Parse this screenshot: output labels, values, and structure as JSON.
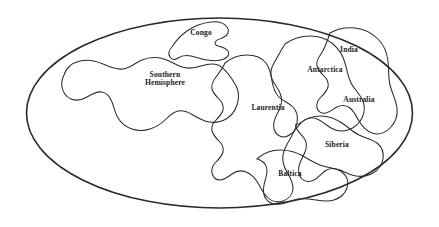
{
  "figure": {
    "kind": "paleogeographic-reconstruction-map",
    "projection_shape": "ellipse",
    "background_color": "#ffffff",
    "outline_color": "#2b2b2b",
    "label_color": "#1d1d1d",
    "globe": {
      "center_x": 219.5,
      "center_y": 113,
      "radius_x": 193,
      "radius_y": 95,
      "stroke_width": 1.6
    }
  },
  "labels": [
    {
      "id": "congo",
      "text": "Congo",
      "x": 201,
      "y": 33,
      "font_size": 7.6,
      "lines": [
        "Congo"
      ]
    },
    {
      "id": "southern-hemisphere",
      "text": "Southern Hemisphere",
      "x": 165,
      "y": 79,
      "font_size": 7.6,
      "lines": [
        "Southern",
        "Hemisphere"
      ]
    },
    {
      "id": "antarctica",
      "text": "Antarctica",
      "x": 325,
      "y": 70,
      "font_size": 7.6,
      "lines": [
        "Antarctica"
      ]
    },
    {
      "id": "india",
      "text": "India",
      "x": 349,
      "y": 50,
      "font_size": 7.6,
      "lines": [
        "India"
      ]
    },
    {
      "id": "australia",
      "text": "Australia",
      "x": 359,
      "y": 100,
      "font_size": 7.6,
      "lines": [
        "Australia"
      ]
    },
    {
      "id": "laurentia",
      "text": "Laurentia",
      "x": 268,
      "y": 108,
      "font_size": 7.6,
      "lines": [
        "Laurentia"
      ]
    },
    {
      "id": "siberia",
      "text": "Siberia",
      "x": 337,
      "y": 145,
      "font_size": 7.6,
      "lines": [
        "Siberia"
      ]
    },
    {
      "id": "baltica",
      "text": "Baltica",
      "x": 290,
      "y": 174,
      "font_size": 7.6,
      "lines": [
        "Baltica"
      ]
    }
  ],
  "landmasses": [
    {
      "id": "congo-craton",
      "name": "Congo",
      "path": "M172 47 C175 42 180 36 187 31 C194 26 202 23 211 22 C218 21 224 23 227 27 C230 31 228 35 224 37 C221 39 218 39 216 41 C214 43 215 45 218 46 C222 47 226 48 228 51 C230 54 228 57 224 59 C219 61 213 61 207 60 C201 59 196 57 191 56 C186 55 181 56 178 58 C175 60 172 60 170 57 C168 54 169 50 172 47 Z"
    },
    {
      "id": "southern-hemisphere-craton",
      "name": "Southern Hemisphere",
      "path": "M64 75 C66 68 72 63 80 61 C88 59 96 61 103 64 C110 67 116 70 123 69 C130 68 135 63 142 60 C149 57 157 57 164 59 C171 61 176 65 182 67 C188 69 195 68 201 66 C207 64 213 63 218 65 C223 67 226 71 229 75 C232 79 235 83 237 88 C239 93 239 99 237 105 C235 111 231 116 226 119 C221 122 215 123 209 122 C203 121 198 118 193 115 C188 112 183 110 178 111 C173 112 169 116 165 120 C161 124 156 127 150 129 C144 131 138 131 132 129 C126 127 121 123 118 118 C115 113 114 107 112 102 C110 97 107 93 102 92 C97 91 92 94 87 97 C82 100 76 101 71 99 C66 97 63 92 62 87 C61 82 62 79 64 75 Z"
    },
    {
      "id": "laurentia-craton",
      "name": "Laurentia",
      "path": "M225 63 C231 58 239 55 247 55 C255 55 262 58 266 63 C270 68 271 75 272 81 C273 87 275 93 279 97 C283 101 289 103 293 107 C297 111 298 117 297 123 C296 129 293 134 290 139 C287 144 284 149 283 155 C282 161 284 167 287 172 C290 177 293 182 293 188 C293 194 289 199 283 201 C277 203 271 201 267 197 C263 193 261 188 258 183 C255 178 251 174 246 172 C241 170 236 171 232 174 C228 177 224 180 220 180 C216 180 213 177 212 173 C211 169 213 165 216 162 C219 159 222 156 223 152 C224 148 222 144 219 141 C216 138 213 135 212 131 C211 127 213 123 216 120 C219 117 222 114 223 110 C224 106 222 102 219 99 C216 96 213 93 212 89 C211 85 213 81 216 77 C219 73 222 69 224 65 Z"
    },
    {
      "id": "antarctica-craton",
      "name": "Antarctica",
      "path": "M285 44 C292 39 301 36 310 36 C319 36 327 39 333 44 C339 49 343 56 345 63 C347 70 348 77 351 83 C354 89 359 93 362 99 C365 105 365 112 362 118 C359 124 354 128 348 130 C342 132 336 131 331 128 C326 125 322 121 317 119 C312 117 306 118 302 122 C298 126 295 131 291 134 C287 137 282 138 278 135 C274 132 273 127 274 122 C275 117 278 113 280 108 C282 103 282 98 280 93 C278 88 274 84 272 79 C270 74 271 68 274 63 C277 58 280 52 285 44 Z"
    },
    {
      "id": "india-craton",
      "name": "India",
      "path": "M330 33 C337 29 346 27 355 28 C364 29 372 33 378 39 C384 45 387 53 388 61 C389 69 388 77 390 85 C392 93 396 100 397 108 C398 116 395 123 390 128 C385 133 378 135 372 133 C366 131 362 126 359 121 C356 116 354 111 350 108 C346 105 341 105 337 107 C333 109 330 112 326 113 C322 114 318 112 317 108 C316 104 318 100 321 97 C324 94 327 91 328 87 C329 83 327 79 324 76 C321 73 318 70 317 66 C316 62 318 58 321 54 C324 50 327 42 330 33 Z"
    },
    {
      "id": "siberia-craton",
      "name": "Siberia",
      "path": "M299 124 C305 119 313 116 321 116 C329 116 336 119 342 123 C348 127 353 132 359 135 C365 138 372 139 377 143 C382 147 384 153 383 159 C382 165 378 170 373 173 C368 176 362 177 356 176 C350 175 345 172 340 170 C335 168 329 168 325 171 C321 174 318 178 314 180 C310 182 305 182 302 179 C299 176 298 171 299 166 C300 161 303 157 305 152 C307 147 307 142 304 138 C301 134 297 131 296 127 C295 123 296 125 299 124 Z"
    },
    {
      "id": "baltica-craton",
      "name": "Baltica",
      "path": "M258 158 C264 153 272 150 280 150 C288 150 296 152 303 156 C310 160 316 164 323 166 C330 168 337 168 342 172 C347 176 349 182 347 188 C345 194 340 198 334 200 C328 202 322 201 316 200 C310 199 304 198 298 199 C292 200 287 203 281 204 C275 205 269 203 266 199 C263 195 263 190 264 185 C265 180 267 176 267 171 C267 166 264 162 260 160 C256 158 256 160 258 158 Z"
    }
  ]
}
